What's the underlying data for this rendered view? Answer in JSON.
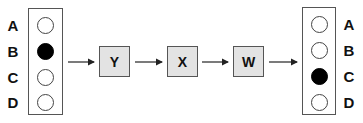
{
  "diagram": {
    "type": "flow",
    "left_panel": {
      "rows": [
        {
          "label": "A",
          "filled": false
        },
        {
          "label": "B",
          "filled": true
        },
        {
          "label": "C",
          "filled": false
        },
        {
          "label": "D",
          "filled": false
        }
      ]
    },
    "nodes": [
      {
        "id": "Y",
        "label": "Y"
      },
      {
        "id": "X",
        "label": "X"
      },
      {
        "id": "W",
        "label": "W"
      }
    ],
    "right_panel": {
      "rows": [
        {
          "label": "A",
          "filled": false
        },
        {
          "label": "B",
          "filled": false
        },
        {
          "label": "C",
          "filled": true
        },
        {
          "label": "D",
          "filled": false
        }
      ]
    },
    "edges": [
      {
        "from": "left_panel",
        "to": "Y"
      },
      {
        "from": "Y",
        "to": "X"
      },
      {
        "from": "X",
        "to": "W"
      },
      {
        "from": "W",
        "to": "right_panel"
      }
    ],
    "colors": {
      "node_fill": "#e3e3e3",
      "filled_circle": "#000000",
      "border": "#555555"
    }
  }
}
